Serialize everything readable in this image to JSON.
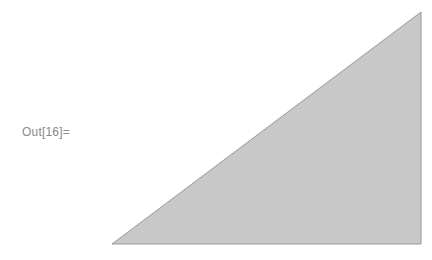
{
  "cell": {
    "output_label": "Out[16]="
  },
  "graphic": {
    "shape": "triangle",
    "points": [
      [
        112,
        244
      ],
      [
        421,
        244
      ],
      [
        421,
        12
      ]
    ],
    "fill": "#c8c8c8",
    "stroke": "#9a9a9a"
  }
}
